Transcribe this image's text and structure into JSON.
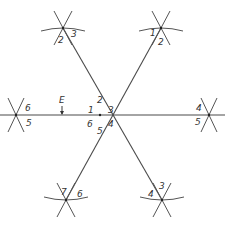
{
  "diagram": {
    "title": "",
    "center": {
      "x": 100,
      "y": 115
    },
    "lines": [
      {
        "id": "horizontal",
        "x1": 0,
        "y1": 115,
        "x2": 225,
        "y2": 115
      },
      {
        "id": "diag-ul-lr",
        "x1": 63,
        "y1": 28,
        "x2": 162,
        "y2": 200
      },
      {
        "id": "diag-ur-ll",
        "x1": 161,
        "y1": 28,
        "x2": 66,
        "y2": 200
      }
    ],
    "end_marks": [
      {
        "id": "top-left",
        "x": 63,
        "y": 28,
        "labels": [
          {
            "text": "2",
            "dx": -5,
            "dy": 15
          },
          {
            "text": "3",
            "dx": 8,
            "dy": 9
          }
        ]
      },
      {
        "id": "top-right",
        "x": 161,
        "y": 28,
        "labels": [
          {
            "text": "1",
            "dx": -11,
            "dy": 8
          },
          {
            "text": "2",
            "dx": -3,
            "dy": 17
          }
        ]
      },
      {
        "id": "left",
        "x": 16,
        "y": 115,
        "labels": [
          {
            "text": "6",
            "dx": 9,
            "dy": -4
          },
          {
            "text": "5",
            "dx": 10,
            "dy": 11
          }
        ]
      },
      {
        "id": "right",
        "x": 209,
        "y": 115,
        "labels": [
          {
            "text": "4",
            "dx": -13,
            "dy": -4
          },
          {
            "text": "5",
            "dx": -14,
            "dy": 10
          }
        ]
      },
      {
        "id": "bottom-left",
        "x": 66,
        "y": 200,
        "labels": [
          {
            "text": "7",
            "dx": -5,
            "dy": -5
          },
          {
            "text": "6",
            "dx": 11,
            "dy": -3
          }
        ]
      },
      {
        "id": "bottom-right",
        "x": 162,
        "y": 200,
        "labels": [
          {
            "text": "4",
            "dx": -14,
            "dy": -3
          },
          {
            "text": "3",
            "dx": -3,
            "dy": -11
          }
        ]
      }
    ],
    "center_labels": [
      {
        "text": "1",
        "dx": -12,
        "dy": -5
      },
      {
        "text": "2",
        "dx": -3,
        "dy": -15
      },
      {
        "text": "3",
        "dx": 8,
        "dy": -5
      },
      {
        "text": "4",
        "dx": 8,
        "dy": 9
      },
      {
        "text": "5",
        "dx": -3,
        "dy": 16
      },
      {
        "text": "6",
        "dx": -13,
        "dy": 9
      }
    ],
    "marker": {
      "label": "E",
      "x": 62,
      "y": 107
    }
  }
}
